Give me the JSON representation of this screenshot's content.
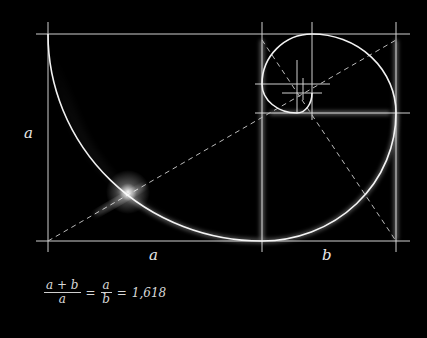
{
  "diagram": {
    "labels": {
      "left_side": "a",
      "bottom_a": "a",
      "bottom_b": "b"
    },
    "formula": {
      "lhs_numerator": "a + b",
      "lhs_denominator": "a",
      "equals1": "=",
      "mid_numerator": "a",
      "mid_denominator": "b",
      "equals2": "=",
      "result": "1,618"
    },
    "colors": {
      "background": "#000000",
      "line": "#d0d0d0",
      "glow": "#ffffff"
    }
  }
}
